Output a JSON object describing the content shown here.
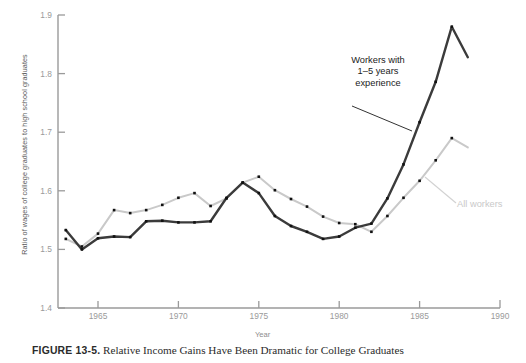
{
  "figure": {
    "caption_label": "FIGURE 13-5.",
    "caption_text": "Relative Income Gains Have Been Dramatic for College Graduates"
  },
  "annotations": {
    "experienced_line1": "Workers with",
    "experienced_line2": "1–5 years",
    "experienced_line3": "experience",
    "all_workers": "All workers"
  },
  "chart_data": {
    "type": "line",
    "title": "",
    "xlabel": "Year",
    "ylabel": "Ratio of wages of college graduates to high school graduates",
    "xlim": [
      1963,
      1990
    ],
    "ylim": [
      1.4,
      1.9
    ],
    "xticks": [
      1965,
      1970,
      1975,
      1980,
      1985,
      1990
    ],
    "yticks": [
      1.4,
      1.5,
      1.6,
      1.7,
      1.8,
      1.9
    ],
    "grid": false,
    "legend": "inline-annotations",
    "colors": {
      "all_workers": "#c9c9c9",
      "experienced": "#3b3b3b",
      "marker": "#111111",
      "axis": "#9a9a9a"
    },
    "x": [
      1963,
      1964,
      1965,
      1966,
      1967,
      1968,
      1969,
      1970,
      1971,
      1972,
      1973,
      1974,
      1975,
      1976,
      1977,
      1978,
      1979,
      1980,
      1981,
      1982,
      1983,
      1984,
      1985,
      1986,
      1987
    ],
    "series": [
      {
        "name": "All workers",
        "color": "#c9c9c9",
        "values": [
          1.518,
          1.505,
          1.527,
          1.567,
          1.562,
          1.567,
          1.576,
          1.588,
          1.596,
          1.574,
          1.587,
          1.614,
          1.624,
          1.601,
          1.586,
          1.573,
          1.556,
          1.545,
          1.543,
          1.53,
          1.557,
          1.588,
          1.617,
          1.652,
          1.69
        ]
      },
      {
        "name": "Workers with 1–5 years experience",
        "color": "#3b3b3b",
        "values": [
          1.533,
          1.5,
          1.519,
          1.522,
          1.521,
          1.548,
          1.549,
          1.546,
          1.546,
          1.548,
          1.588,
          1.614,
          1.596,
          1.557,
          1.54,
          1.53,
          1.518,
          1.522,
          1.537,
          1.544,
          1.587,
          1.645,
          1.717,
          1.786,
          1.88
        ]
      }
    ],
    "series_endpoints": [
      {
        "name": "All workers",
        "last_x": 1988,
        "last_value": 1.674
      },
      {
        "name": "Workers with 1–5 years experience",
        "last_x": 1988,
        "last_value": 1.828
      }
    ]
  }
}
